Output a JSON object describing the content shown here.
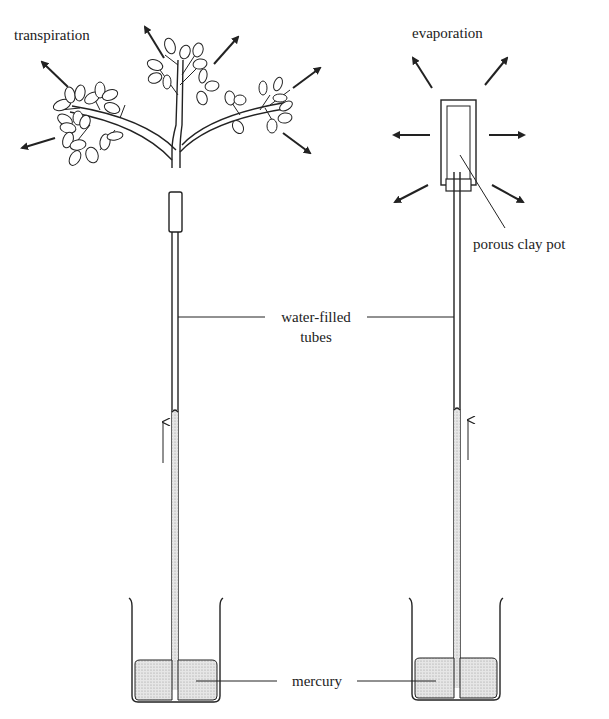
{
  "diagram": {
    "title_fragment": "",
    "labels": {
      "transpiration": "transpiration",
      "evaporation": "evaporation",
      "porous_pot": "porous clay pot",
      "tubes_line1": "water-filled",
      "tubes_line2": "tubes",
      "mercury": "mercury"
    },
    "colors": {
      "ink": "#222222",
      "mercury_fill": "#d8d8d8",
      "background": "#ffffff"
    }
  }
}
